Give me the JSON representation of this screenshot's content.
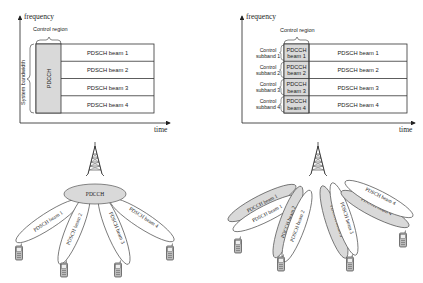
{
  "left_grid": {
    "y_axis_label": "frequency",
    "x_axis_label": "time",
    "control_region_label": "Control region",
    "bandwidth_label": "System bandwidth",
    "pdcch_label": "PDCCH",
    "pdsch_beams": [
      "PDSCH beam 1",
      "PDSCH beam 2",
      "PDSCH beam 3",
      "PDSCH beam 4"
    ]
  },
  "right_grid": {
    "y_axis_label": "frequency",
    "x_axis_label": "time",
    "control_region_label": "Control region",
    "subbands": [
      {
        "label_line1": "Control",
        "label_line2": "subband 1",
        "pdcch_line1": "PDCCH",
        "pdcch_line2": "beam 1",
        "pdsch": "PDSCH beam 1"
      },
      {
        "label_line1": "Control",
        "label_line2": "subband 2",
        "pdcch_line1": "PDCCH",
        "pdcch_line2": "beam 2",
        "pdsch": "PDSCH beam 2"
      },
      {
        "label_line1": "Control",
        "label_line2": "subband 3",
        "pdcch_line1": "PDCCH",
        "pdcch_line2": "beam 3",
        "pdsch": "PDSCH beam 3"
      },
      {
        "label_line1": "Control",
        "label_line2": "subband 4",
        "pdcch_line1": "PDCCH",
        "pdcch_line2": "beam 4",
        "pdsch": "PDSCH beam 4"
      }
    ]
  },
  "left_beams": {
    "broadcast_label": "PDCCH",
    "beams": [
      "PDSCH beam 1",
      "PDSCH beam 2",
      "PDSCH beam 3",
      "PDSCH beam 4"
    ]
  },
  "right_beams": {
    "pdcch_beams": [
      "PDCCH beam 1",
      "PDCCH beam 2",
      "PDCCH beam 3",
      "PDCCH beam 4"
    ],
    "pdsch_beams": [
      "PDSCH beam 1",
      "PDSCH beam 2",
      "PDSCH beam 3",
      "PDSCH beam 4"
    ]
  },
  "colors": {
    "pdcch_fill": "#d9d9d9",
    "line": "#333333",
    "beam_outline": "#555555"
  }
}
